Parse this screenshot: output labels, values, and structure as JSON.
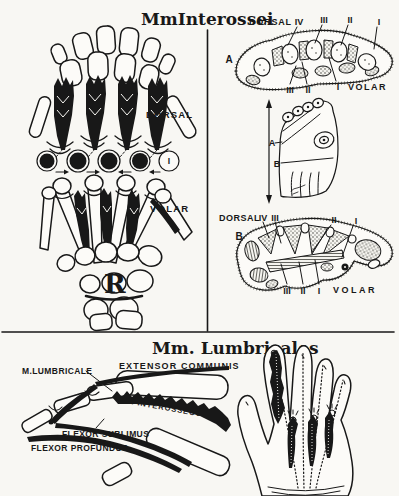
{
  "colors": {
    "paper": "#f8f7f3",
    "ink": "#181818"
  },
  "interossei_panel": {
    "title": "MmInterossei",
    "dorsal_label": "DORSAL",
    "volar_label": "VOLAR",
    "circled_numerals": [
      "V",
      "IV",
      "III",
      "II",
      "I"
    ],
    "r_label": "R"
  },
  "cross_section_a": {
    "panel_letter": "A",
    "dorsal_label": "DORSAL",
    "top_numerals": [
      "IV",
      "III",
      "II",
      "I"
    ],
    "bottom_numerals": [
      "III",
      "II",
      "I"
    ],
    "volar_label": "VOLAR"
  },
  "mini_hand": {
    "section_a_label": "A",
    "section_b_label": "B"
  },
  "cross_section_b": {
    "panel_letter": "B",
    "dorsal_label": "DORSAL",
    "top_numerals": [
      "IV",
      "III",
      "II",
      "I"
    ],
    "bottom_numerals": [
      "III",
      "II",
      "I"
    ],
    "volar_label": "VOLAR"
  },
  "lumbricales_panel": {
    "title": "Mm. Lumbricales",
    "labels": {
      "lumbricale": "M.LUMBRICALE",
      "extensor": "EXTENSOR COMMUNIS",
      "interosseous": "M. INTEROSSEOUS",
      "flexor_sublimus": "FLEXOR SUBLIMUS",
      "flexor_profundus": "FLEXOR PROFUNDUS"
    }
  }
}
